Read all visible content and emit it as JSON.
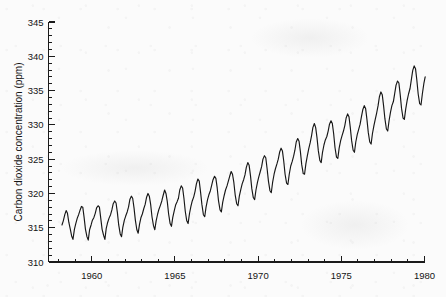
{
  "chart_data": {
    "type": "line",
    "title": "",
    "subtitle": "",
    "xlabel": "",
    "ylabel": "Carbon dioxide concentration (ppm)",
    "xlim": [
      1957.4,
      1980.3
    ],
    "ylim": [
      310,
      345
    ],
    "grid": false,
    "legend": "none",
    "x_major_ticks": [
      1960,
      1965,
      1970,
      1975,
      1980
    ],
    "x_major_tick_labels": [
      "1960",
      "1965",
      "1970",
      "1975",
      "1980"
    ],
    "x_minor_tick_step": 1,
    "y_major_ticks": [
      310,
      315,
      320,
      325,
      330,
      335,
      340,
      345
    ],
    "y_major_tick_labels": [
      "310",
      "315",
      "320",
      "325",
      "330",
      "335",
      "340",
      "345"
    ],
    "y_minor_tick_step": 1,
    "series": [
      {
        "name": "Mauna Loa monthly mean CO2",
        "x": [
          1958.21,
          1958.29,
          1958.38,
          1958.46,
          1958.54,
          1958.62,
          1958.71,
          1958.79,
          1958.87,
          1958.96,
          1959.04,
          1959.13,
          1959.21,
          1959.29,
          1959.38,
          1959.46,
          1959.54,
          1959.62,
          1959.71,
          1959.79,
          1959.87,
          1959.96,
          1960.04,
          1960.13,
          1960.21,
          1960.29,
          1960.38,
          1960.46,
          1960.54,
          1960.62,
          1960.71,
          1960.79,
          1960.87,
          1960.96,
          1961.04,
          1961.13,
          1961.21,
          1961.29,
          1961.38,
          1961.46,
          1961.54,
          1961.62,
          1961.71,
          1961.79,
          1961.87,
          1961.96,
          1962.04,
          1962.13,
          1962.21,
          1962.29,
          1962.38,
          1962.46,
          1962.54,
          1962.62,
          1962.71,
          1962.79,
          1962.87,
          1962.96,
          1963.04,
          1963.13,
          1963.21,
          1963.29,
          1963.38,
          1963.46,
          1963.54,
          1963.62,
          1963.71,
          1963.79,
          1963.87,
          1963.96,
          1964.04,
          1964.13,
          1964.21,
          1964.29,
          1964.38,
          1964.46,
          1964.54,
          1964.62,
          1964.71,
          1964.79,
          1964.87,
          1964.96,
          1965.04,
          1965.13,
          1965.21,
          1965.29,
          1965.38,
          1965.46,
          1965.54,
          1965.62,
          1965.71,
          1965.79,
          1965.87,
          1965.96,
          1966.04,
          1966.13,
          1966.21,
          1966.29,
          1966.38,
          1966.46,
          1966.54,
          1966.62,
          1966.71,
          1966.79,
          1966.87,
          1966.96,
          1967.04,
          1967.13,
          1967.21,
          1967.29,
          1967.38,
          1967.46,
          1967.54,
          1967.62,
          1967.71,
          1967.79,
          1967.87,
          1967.96,
          1968.04,
          1968.13,
          1968.21,
          1968.29,
          1968.38,
          1968.46,
          1968.54,
          1968.62,
          1968.71,
          1968.79,
          1968.87,
          1968.96,
          1969.04,
          1969.13,
          1969.21,
          1969.29,
          1969.38,
          1969.46,
          1969.54,
          1969.62,
          1969.71,
          1969.79,
          1969.87,
          1969.96,
          1970.04,
          1970.13,
          1970.21,
          1970.29,
          1970.38,
          1970.46,
          1970.54,
          1970.62,
          1970.71,
          1970.79,
          1970.87,
          1970.96,
          1971.04,
          1971.13,
          1971.21,
          1971.29,
          1971.38,
          1971.46,
          1971.54,
          1971.62,
          1971.71,
          1971.79,
          1971.87,
          1971.96,
          1972.04,
          1972.13,
          1972.21,
          1972.29,
          1972.38,
          1972.46,
          1972.54,
          1972.62,
          1972.71,
          1972.79,
          1972.87,
          1972.96,
          1973.04,
          1973.13,
          1973.21,
          1973.29,
          1973.38,
          1973.46,
          1973.54,
          1973.62,
          1973.71,
          1973.79,
          1973.87,
          1973.96,
          1974.04,
          1974.13,
          1974.21,
          1974.29,
          1974.38,
          1974.46,
          1974.54,
          1974.62,
          1974.71,
          1974.79,
          1974.87,
          1974.96,
          1975.04,
          1975.13,
          1975.21,
          1975.29,
          1975.38,
          1975.46,
          1975.54,
          1975.62,
          1975.71,
          1975.79,
          1975.87,
          1975.96,
          1976.04,
          1976.13,
          1976.21,
          1976.29,
          1976.38,
          1976.46,
          1976.54,
          1976.62,
          1976.71,
          1976.79,
          1976.87,
          1976.96,
          1977.04,
          1977.13,
          1977.21,
          1977.29,
          1977.38,
          1977.46,
          1977.54,
          1977.62,
          1977.71,
          1977.79,
          1977.87,
          1977.96,
          1978.04,
          1978.13,
          1978.21,
          1978.29,
          1978.38,
          1978.46,
          1978.54,
          1978.62,
          1978.71,
          1978.79,
          1978.87,
          1978.96,
          1979.04,
          1979.13,
          1979.21,
          1979.29,
          1979.38,
          1979.46,
          1979.54,
          1979.62,
          1979.71,
          1979.79,
          1979.87,
          1979.96,
          1980.04
        ],
        "y": [
          315.4,
          316.0,
          316.9,
          317.5,
          317.1,
          315.8,
          314.8,
          313.8,
          313.3,
          314.8,
          315.6,
          316.4,
          316.9,
          317.5,
          318.1,
          318.0,
          316.5,
          314.8,
          313.7,
          313.2,
          314.7,
          315.4,
          316.1,
          316.5,
          317.1,
          317.9,
          318.2,
          318.0,
          316.4,
          314.8,
          313.9,
          313.3,
          314.9,
          315.8,
          316.4,
          316.9,
          317.6,
          318.5,
          318.9,
          318.6,
          317.2,
          315.4,
          314.1,
          313.7,
          315.1,
          316.1,
          316.7,
          317.3,
          318.0,
          319.1,
          319.6,
          319.3,
          317.9,
          316.1,
          314.7,
          314.2,
          315.5,
          316.5,
          317.0,
          317.8,
          318.4,
          319.4,
          320.0,
          319.6,
          318.4,
          316.6,
          315.3,
          314.7,
          316.0,
          317.0,
          317.7,
          318.3,
          318.9,
          319.7,
          320.5,
          320.0,
          318.8,
          317.0,
          315.6,
          315.2,
          316.5,
          317.5,
          318.3,
          318.8,
          319.3,
          320.5,
          321.1,
          320.8,
          319.3,
          317.4,
          316.0,
          315.6,
          317.0,
          318.1,
          318.9,
          319.5,
          320.3,
          321.4,
          322.1,
          321.8,
          320.2,
          318.4,
          316.9,
          316.6,
          318.0,
          319.1,
          319.8,
          320.4,
          321.2,
          322.0,
          322.5,
          322.2,
          320.8,
          318.9,
          317.6,
          317.3,
          318.7,
          319.7,
          320.5,
          321.1,
          321.8,
          322.5,
          323.2,
          322.8,
          321.6,
          319.8,
          318.5,
          318.2,
          319.6,
          320.6,
          321.4,
          322.0,
          322.7,
          323.8,
          324.5,
          324.1,
          322.6,
          320.7,
          319.4,
          319.1,
          320.5,
          321.6,
          322.4,
          323.2,
          323.9,
          325.0,
          325.5,
          325.2,
          323.6,
          321.8,
          320.4,
          320.1,
          321.6,
          322.8,
          323.6,
          324.3,
          325.0,
          326.0,
          326.6,
          326.2,
          324.7,
          322.8,
          321.5,
          321.3,
          322.8,
          324.0,
          324.6,
          325.4,
          326.3,
          327.5,
          328.0,
          327.6,
          326.1,
          324.2,
          322.9,
          322.8,
          324.3,
          325.5,
          326.5,
          327.4,
          328.4,
          329.6,
          330.2,
          329.6,
          328.1,
          326.2,
          324.8,
          324.5,
          326.0,
          327.1,
          327.8,
          328.3,
          329.1,
          330.1,
          330.6,
          330.2,
          328.7,
          326.7,
          325.3,
          325.1,
          326.6,
          327.7,
          328.4,
          329.1,
          329.9,
          331.0,
          331.6,
          331.2,
          329.6,
          327.7,
          326.3,
          326.0,
          327.5,
          328.6,
          329.3,
          330.1,
          331.2,
          332.2,
          332.8,
          332.4,
          330.8,
          328.9,
          327.5,
          327.2,
          328.7,
          329.9,
          330.8,
          331.8,
          332.8,
          334.1,
          334.8,
          334.4,
          332.8,
          330.9,
          329.4,
          329.1,
          330.6,
          331.9,
          332.8,
          333.4,
          334.6,
          335.8,
          336.4,
          336.1,
          334.4,
          332.4,
          331.0,
          330.8,
          332.3,
          333.6,
          334.5,
          335.3,
          336.6,
          337.9,
          338.6,
          338.2,
          336.5,
          334.5,
          333.1,
          332.9,
          334.5,
          336.0,
          337.0
        ],
        "color": "#171717",
        "style": "solid",
        "width": 1.15
      }
    ]
  },
  "axes": {
    "y_axis_title": "Carbon dioxide concentration (ppm)",
    "x_axis_title": ""
  }
}
